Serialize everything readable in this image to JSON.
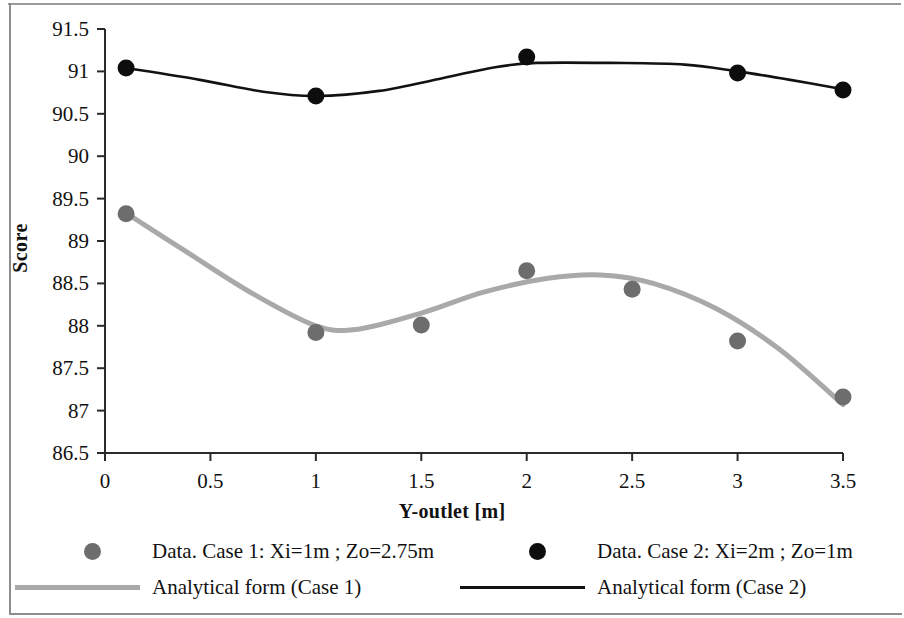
{
  "chart_data": {
    "type": "line",
    "title": "",
    "xlabel": "Y-outlet [m]",
    "ylabel": "Score",
    "xlim": [
      0,
      3.5
    ],
    "ylim": [
      86.5,
      91.5
    ],
    "xticks": [
      "0",
      "0.5",
      "1",
      "1.5",
      "2",
      "2.5",
      "3",
      "3.5"
    ],
    "xtick_values": [
      0,
      0.5,
      1,
      1.5,
      2,
      2.5,
      3,
      3.5
    ],
    "yticks": [
      "86.5",
      "87",
      "87.5",
      "88",
      "88.5",
      "89",
      "89.5",
      "90",
      "90.5",
      "91",
      "91.5"
    ],
    "ytick_values": [
      86.5,
      87,
      87.5,
      88,
      88.5,
      89,
      89.5,
      90,
      90.5,
      91,
      91.5
    ],
    "grid": false,
    "legend_position": "below",
    "series": [
      {
        "name": "Data. Case 1: Xi=1m ; Zo=2.75m",
        "kind": "scatter",
        "color": "#6d6d6d",
        "x": [
          0.1,
          1.0,
          1.5,
          2.0,
          2.5,
          3.0,
          3.5
        ],
        "values": [
          89.32,
          87.92,
          88.01,
          88.65,
          88.43,
          87.82,
          87.16
        ]
      },
      {
        "name": "Analytical form (Case 1)",
        "kind": "line",
        "color": "#a9a9a9",
        "x": [
          0.1,
          0.4,
          0.7,
          1.0,
          1.2,
          1.5,
          1.8,
          2.1,
          2.35,
          2.6,
          2.9,
          3.2,
          3.5
        ],
        "values": [
          89.33,
          88.85,
          88.38,
          88.0,
          87.96,
          88.15,
          88.4,
          88.56,
          88.6,
          88.5,
          88.2,
          87.72,
          87.07
        ]
      },
      {
        "name": "Data. Case 2: Xi=2m ; Zo=1m",
        "kind": "scatter",
        "color": "#0d0d0d",
        "x": [
          0.1,
          1.0,
          2.0,
          3.0,
          3.5
        ],
        "values": [
          91.04,
          90.71,
          91.17,
          90.98,
          90.78
        ]
      },
      {
        "name": "Analytical form (Case 2)",
        "kind": "line",
        "color": "#121212",
        "x": [
          0.1,
          0.45,
          0.75,
          1.0,
          1.3,
          1.6,
          1.85,
          2.05,
          2.4,
          2.75,
          3.0,
          3.25,
          3.5
        ],
        "values": [
          91.04,
          90.9,
          90.76,
          90.71,
          90.77,
          90.92,
          91.05,
          91.1,
          91.1,
          91.08,
          91.0,
          90.9,
          90.79
        ]
      }
    ]
  },
  "axes": {
    "ylabel": "Score",
    "xlabel": "Y-outlet [m]"
  },
  "legend": {
    "rows": [
      {
        "left": {
          "marker": "filled-circle-gray",
          "label": "Data. Case 1: Xi=1m ; Zo=2.75m"
        },
        "right": {
          "marker": "filled-circle-black",
          "label": "Data. Case 2: Xi=2m ;  Zo=1m"
        }
      },
      {
        "left": {
          "marker": "line-gray",
          "label": "Analytical form (Case 1)"
        },
        "right": {
          "marker": "line-black",
          "label": "Analytical form (Case 2)"
        }
      }
    ]
  },
  "colors": {
    "case1": "#6d6d6d",
    "case1_line": "#a9a9a9",
    "case2": "#0d0d0d",
    "case2_line": "#121212",
    "axis": "#2a2a2a",
    "frame": "#8d8d8d"
  }
}
